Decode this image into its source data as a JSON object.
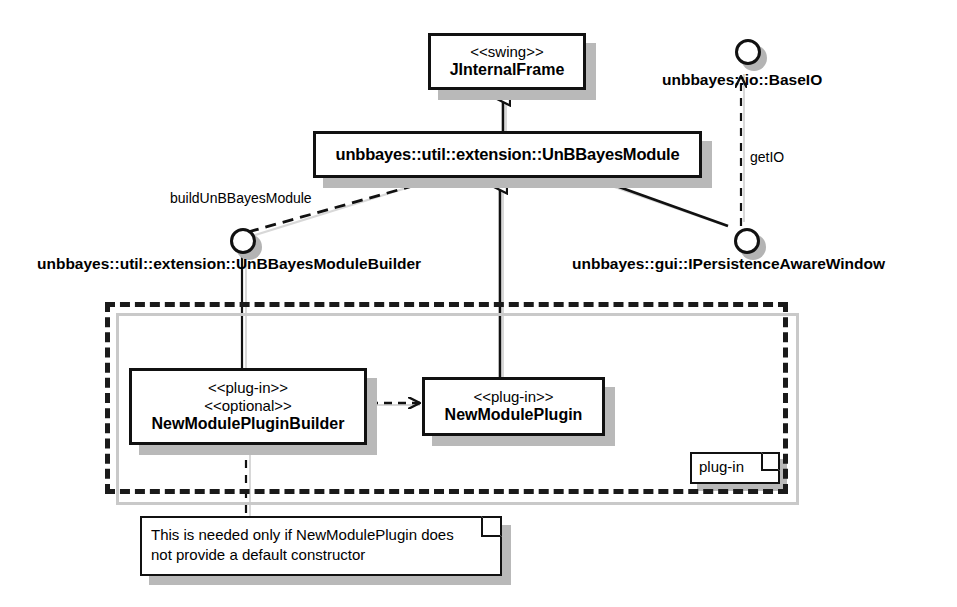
{
  "diagram": {
    "kind": "uml-class-diagram",
    "colors": {
      "stroke": "#111111",
      "fill": "#ffffff",
      "shadow": "#b9b9b9",
      "package_shadow": "#c9c9c9"
    }
  },
  "classes": [
    {
      "id": "jinternalframe",
      "stereotypes": [
        "<<swing>>"
      ],
      "name": "JInternalFrame",
      "x": 428,
      "y": 33,
      "w": 158,
      "h": 57
    },
    {
      "id": "unbbayesmodule",
      "stereotypes": [],
      "name": "unbbayes::util::extension::UnBBayesModule",
      "x": 313,
      "y": 131,
      "w": 389,
      "h": 47
    },
    {
      "id": "newmodulepluginbuilder",
      "stereotypes": [
        "<<plug-in>>",
        "<<optional>>"
      ],
      "name": "NewModulePluginBuilder",
      "x": 129,
      "y": 368,
      "w": 238,
      "h": 77
    },
    {
      "id": "newmoduleplugin",
      "stereotypes": [
        "<<plug-in>>"
      ],
      "name": "NewModulePlugin",
      "x": 422,
      "y": 377,
      "w": 183,
      "h": 59
    }
  ],
  "interfaces": [
    {
      "id": "baseio",
      "label": "unbbayes::io::BaseIO",
      "circle_x": 735,
      "circle_y": 39,
      "label_x": 662,
      "label_y": 71
    },
    {
      "id": "unbbayesmodulebuilder",
      "label": "unbbayes::util::extension::UnBBayesModuleBuilder",
      "circle_x": 230,
      "circle_y": 228,
      "label_x": 37,
      "label_y": 255
    },
    {
      "id": "ipersistenceawarewindow",
      "label": "unbbayes::gui::IPersistenceAwareWindow",
      "circle_x": 734,
      "circle_y": 228,
      "label_x": 572,
      "label_y": 255
    }
  ],
  "edge_labels": [
    {
      "id": "buildunbbayesmodule",
      "text": "buildUnBBayesModule",
      "x": 170,
      "y": 190
    },
    {
      "id": "getio",
      "text": "getIO",
      "x": 750,
      "y": 149
    }
  ],
  "package": {
    "id": "plugin-package",
    "tab_label": "plug-in",
    "x": 105,
    "y": 302,
    "w": 683,
    "h": 192,
    "tab_x": 690,
    "tab_y": 452,
    "tab_w": 90,
    "tab_h": 32
  },
  "note": {
    "id": "default-constructor-note",
    "lines": [
      "This is needed only if NewModulePlugin does",
      "not provide a default constructor"
    ],
    "x": 140,
    "y": 516,
    "w": 362,
    "h": 60
  },
  "relations": [
    {
      "id": "module-extends-jinternalframe",
      "type": "generalization",
      "from": "unbbayesmodule",
      "to": "jinternalframe"
    },
    {
      "id": "newmoduleplugin-extends-module",
      "type": "generalization",
      "from": "newmoduleplugin",
      "to": "unbbayesmodule"
    },
    {
      "id": "builder-builds-module",
      "type": "dependency",
      "label": "buildUnBBayesModule",
      "from": "unbbayesmodulebuilder",
      "to": "unbbayesmodule"
    },
    {
      "id": "module-realizes-ipersistenceawarewindow",
      "type": "realization-link",
      "from": "unbbayesmodule",
      "to": "ipersistenceawarewindow"
    },
    {
      "id": "ipersistenceawarewindow-getio-baseio",
      "type": "dependency",
      "label": "getIO",
      "from": "ipersistenceawarewindow",
      "to": "baseio"
    },
    {
      "id": "builder-realized-by-newmodulepluginbuilder",
      "type": "realization-link",
      "from": "unbbayesmodulebuilder",
      "to": "newmodulepluginbuilder"
    },
    {
      "id": "builder-creates-plugin",
      "type": "dependency",
      "from": "newmodulepluginbuilder",
      "to": "newmoduleplugin"
    },
    {
      "id": "note-anchor",
      "type": "note-link",
      "from": "newmodulepluginbuilder",
      "to": "default-constructor-note"
    }
  ]
}
